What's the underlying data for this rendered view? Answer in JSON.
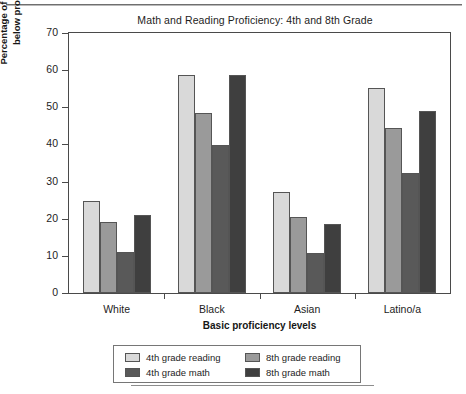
{
  "chart_data": {
    "type": "bar",
    "title": "Math and Reading Proficiency: 4th and 8th Grade",
    "xlabel": "Basic proficiency levels",
    "ylabel_line1": "Percentage of students who fall",
    "ylabel_line2": "below proficiency level",
    "categories": [
      "White",
      "Black",
      "Asian",
      "Latino/a"
    ],
    "series": [
      {
        "name": "4th grade reading",
        "color": "#d9d9d9",
        "values": [
          24.9,
          58.8,
          27.3,
          55.2
        ]
      },
      {
        "name": "8th grade reading",
        "color": "#9a9a9a",
        "values": [
          19.0,
          48.6,
          20.5,
          44.4
        ]
      },
      {
        "name": "4th grade math",
        "color": "#595959",
        "values": [
          11.0,
          39.9,
          10.8,
          32.4
        ]
      },
      {
        "name": "8th grade math",
        "color": "#3f3f3f",
        "values": [
          20.9,
          58.6,
          18.6,
          49.1
        ]
      }
    ],
    "ylim": [
      0,
      70
    ],
    "yticks": [
      0,
      10,
      20,
      30,
      40,
      50,
      60,
      70
    ],
    "ytick_labels": [
      "0",
      "10",
      "20",
      "30",
      "40",
      "50",
      "60",
      "70"
    ],
    "grid": false,
    "legend_position": "bottom",
    "axis_color": "#4a4a4a"
  }
}
